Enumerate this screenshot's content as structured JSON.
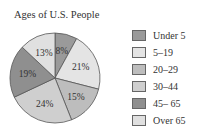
{
  "chart_data": {
    "type": "pie",
    "title": "Ages of U.S. People",
    "categories": [
      "Under 5",
      "5–19",
      "20–29",
      "30–44",
      "45– 65",
      "Over 65"
    ],
    "values": [
      8,
      21,
      15,
      24,
      19,
      13
    ],
    "value_labels": [
      "8%",
      "21%",
      "15%",
      "24%",
      "19%",
      "13%"
    ],
    "colors": [
      "#9a9a9a",
      "#e4e4e4",
      "#bdbdbd",
      "#cfcfcf",
      "#8f8f8f",
      "#e0e0e0"
    ],
    "legend_position": "right"
  }
}
